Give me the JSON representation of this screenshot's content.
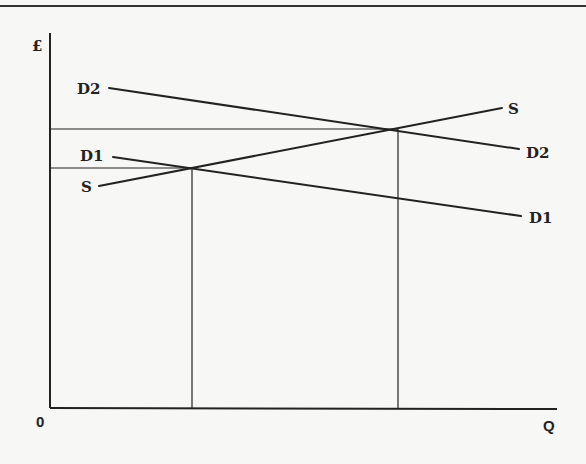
{
  "diagram": {
    "type": "supply-demand",
    "axes": {
      "y_label": "£",
      "x_label": "Q",
      "origin_label": "0"
    },
    "curves": [
      {
        "id": "D2",
        "label_left": "D2",
        "label_right": "D2",
        "kind": "demand"
      },
      {
        "id": "D1",
        "label_left": "D1",
        "label_right": "D1",
        "kind": "demand"
      },
      {
        "id": "S",
        "label_left": "S",
        "label_right": "S",
        "kind": "supply"
      }
    ],
    "equilibria": [
      {
        "name": "E1",
        "between": [
          "S",
          "D1"
        ]
      },
      {
        "name": "E2",
        "between": [
          "S",
          "D2"
        ]
      }
    ]
  },
  "colors": {
    "line": "#222222",
    "background": "#f7f7f5"
  }
}
